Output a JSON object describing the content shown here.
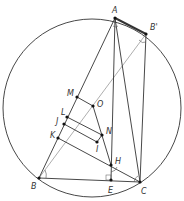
{
  "figure": {
    "type": "geometry",
    "circle": {
      "cx": 92,
      "cy": 108,
      "r": 89
    },
    "points": {
      "A": {
        "x": 115,
        "y": 18,
        "label": "A",
        "lx": 112,
        "ly": 7
      },
      "B2": {
        "x": 146,
        "y": 34,
        "label": "B'",
        "lx": 150,
        "ly": 24
      },
      "B": {
        "x": 39,
        "y": 178,
        "label": "B",
        "lx": 31,
        "ly": 183
      },
      "C": {
        "x": 140,
        "y": 182,
        "label": "C",
        "lx": 141,
        "ly": 188
      },
      "E": {
        "x": 111,
        "y": 180,
        "label": "E",
        "lx": 108,
        "ly": 187
      },
      "H": {
        "x": 111,
        "y": 165,
        "label": "H",
        "lx": 115,
        "ly": 158
      },
      "M": {
        "x": 77,
        "y": 97,
        "label": "M",
        "lx": 67,
        "ly": 90
      },
      "O": {
        "x": 93,
        "y": 106,
        "label": "O",
        "lx": 97,
        "ly": 101
      },
      "L": {
        "x": 67,
        "y": 117,
        "label": "L",
        "lx": 61,
        "ly": 109
      },
      "J": {
        "x": 64,
        "y": 124,
        "label": "J",
        "lx": 56,
        "ly": 118
      },
      "K": {
        "x": 58,
        "y": 138,
        "label": "K",
        "lx": 50,
        "ly": 132
      },
      "N": {
        "x": 102,
        "y": 135,
        "label": "N",
        "lx": 106,
        "ly": 128
      },
      "I": {
        "x": 97,
        "y": 142,
        "label": "I",
        "lx": 96,
        "ly": 146
      }
    },
    "segments": [
      [
        "A",
        "B"
      ],
      [
        "A",
        "C"
      ],
      [
        "B",
        "C"
      ],
      [
        "A",
        "E"
      ],
      [
        "B2",
        "C"
      ],
      [
        "K",
        "C"
      ],
      [
        "O",
        "H"
      ],
      [
        "M",
        "O"
      ],
      [
        "L",
        "N"
      ],
      [
        "J",
        "I"
      ],
      [
        "N",
        "I"
      ]
    ],
    "thin_segments": [
      [
        "B",
        "B2"
      ]
    ],
    "thick_segments": [
      [
        "A",
        "B2"
      ]
    ]
  }
}
